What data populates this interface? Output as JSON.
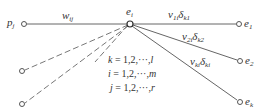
{
  "diagram": {
    "nodes": {
      "p_j": {
        "label": "p",
        "sub": "j",
        "x": 24,
        "y": 24
      },
      "e_i": {
        "label": "e",
        "sub": "i",
        "x": 130,
        "y": 24
      },
      "e_1": {
        "label": "e",
        "sub": "1",
        "x": 239,
        "y": 24
      },
      "e_2": {
        "label": "e",
        "sub": "2",
        "x": 240,
        "y": 61
      },
      "e_k": {
        "label": "e",
        "sub": "k",
        "x": 240,
        "y": 102
      },
      "left_a": {
        "x": 22,
        "y": 71
      },
      "left_b": {
        "x": 22,
        "y": 104
      }
    },
    "edges": {
      "w_ij": {
        "label": "w",
        "sub": "ij"
      },
      "to_e1": {
        "label": "v",
        "sub1": "1i",
        "delta": "δ",
        "sub2": "k1"
      },
      "to_e2": {
        "label": "v",
        "sub1": "2i",
        "delta": "δ",
        "sub2": "k2"
      },
      "to_ek": {
        "label": "v",
        "sub1": "ki",
        "delta": "δ",
        "sub2": "ki"
      }
    },
    "equations": {
      "k": {
        "var": "k",
        "rest": " = 1,2,···,",
        "end": "l"
      },
      "i": {
        "var": "i",
        "rest": " = 1,2,···,",
        "end": "m"
      },
      "j": {
        "var": "j",
        "rest": " = 1,2,···,",
        "end": "r"
      }
    },
    "colors": {
      "line": "#555555",
      "text": "#333333"
    }
  }
}
